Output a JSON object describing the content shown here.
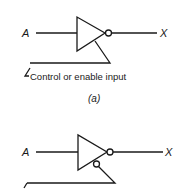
{
  "diagram": {
    "type": "tristate-inverter-symbols",
    "line_color": "#1a1a1a",
    "background": "#ffffff",
    "parts": [
      {
        "id": "a",
        "input_label": "A",
        "output_label": "X",
        "control_label": "Control or enable input",
        "caption": "(a)",
        "control_inverted": false
      },
      {
        "id": "b",
        "input_label": "A",
        "output_label": "X",
        "caption": "",
        "control_inverted": true
      }
    ]
  }
}
